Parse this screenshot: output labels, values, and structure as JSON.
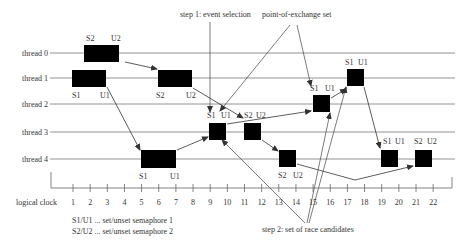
{
  "diagram": {
    "threads": [
      {
        "label": "thread 0",
        "y": 53
      },
      {
        "label": "thread 1",
        "y": 78
      },
      {
        "label": "thread 2",
        "y": 104
      },
      {
        "label": "thread 3",
        "y": 132
      },
      {
        "label": "thread 4",
        "y": 159
      }
    ],
    "axis": {
      "label": "logical clock",
      "ticks": [
        "1",
        "2",
        "3",
        "4",
        "5",
        "6",
        "7",
        "8",
        "9",
        "10",
        "11",
        "12",
        "13",
        "14",
        "15",
        "16",
        "17",
        "18",
        "19",
        "20",
        "21",
        "22"
      ]
    },
    "legend": {
      "line1": "S1/U1 ... set/unset semaphore 1",
      "line2": "S2/U2 ... set/unset semaphore 2"
    },
    "annotations": {
      "step1": "step 1: event selection",
      "point_of_exchange": "point-of-exchange set",
      "step2": "step 2: set of race candidates"
    },
    "blocks": [
      {
        "thread": 0,
        "start_label": "S2",
        "end_label": "U2"
      },
      {
        "thread": 1,
        "start_label": "S1",
        "end_label": "U1"
      },
      {
        "thread": 1,
        "start_label": "S2",
        "end_label": "U2"
      },
      {
        "thread": 4,
        "start_label": "S1",
        "end_label": "U1"
      },
      {
        "thread": 3,
        "start_label": "S1",
        "end_label": "U1"
      },
      {
        "thread": 3,
        "start_label": "S2",
        "end_label": "U2"
      },
      {
        "thread": 4,
        "start_label": "S2",
        "end_label": "U2"
      },
      {
        "thread": 2,
        "start_label": "S1",
        "end_label": "U1"
      },
      {
        "thread": 1,
        "start_label": "S1",
        "end_label": "U1"
      },
      {
        "thread": 4,
        "start_label": "S1",
        "end_label": "U1"
      },
      {
        "thread": 4,
        "start_label": "S2",
        "end_label": "U2"
      }
    ]
  }
}
